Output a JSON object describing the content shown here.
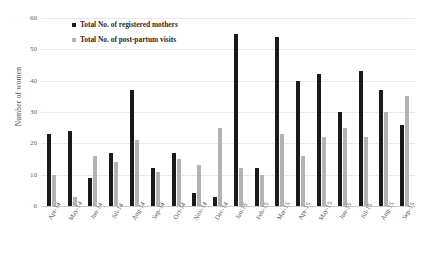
{
  "chart_data": {
    "type": "bar",
    "title": "",
    "subtitle": "",
    "xlabel": "",
    "ylabel": "Number of women",
    "ylim": [
      0,
      60
    ],
    "ytick_step": 10,
    "yticks": [
      0,
      10,
      20,
      30,
      40,
      50,
      60
    ],
    "grid": true,
    "legend_position": "top-left",
    "categories": [
      "Apr-14",
      "May-14",
      "Jun-14",
      "Jul-14",
      "Aug-14",
      "Sep-14",
      "Oct-14",
      "Nov-14",
      "Dec-14",
      "Jan-15",
      "Feb-15",
      "Mar-15",
      "Apr-15",
      "May-15",
      "Jun-15",
      "Jul-15",
      "Aug-15",
      "Sep-15"
    ],
    "series": [
      {
        "name": "Total No. of registered mothers",
        "color": "#1a1a1a",
        "values": [
          23,
          24,
          9,
          17,
          37,
          12,
          17,
          4,
          3,
          55,
          12,
          54,
          40,
          42,
          30,
          43,
          37,
          26
        ]
      },
      {
        "name": "Total No. of post-partum visits",
        "color": "#b3b3b3",
        "values": [
          10,
          3,
          16,
          14,
          21,
          11,
          15,
          13,
          25,
          12,
          10,
          23,
          16,
          22,
          25,
          22,
          30,
          35
        ]
      }
    ]
  }
}
